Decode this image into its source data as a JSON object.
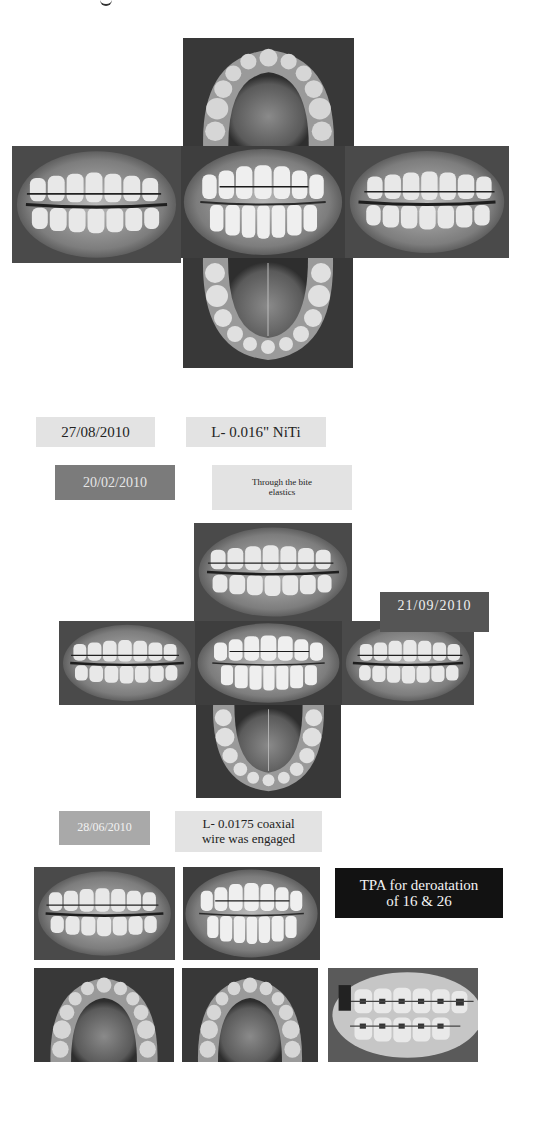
{
  "page": {
    "top_text_fragment": "g"
  },
  "cross_1": {
    "caption": "Pre-treatment intraoral photographs",
    "photos": [
      {
        "view": "upper occlusal",
        "icon": "tooth-photo-icon"
      },
      {
        "view": "right buccal",
        "icon": "tooth-photo-icon"
      },
      {
        "view": "frontal",
        "icon": "tooth-photo-icon"
      },
      {
        "view": "left buccal",
        "icon": "tooth-photo-icon"
      },
      {
        "view": "lower occlusal",
        "icon": "tooth-photo-icon"
      }
    ]
  },
  "labels_1": {
    "date_a": "27/08/2010",
    "wire_a": "L- 0.016\" NiTi",
    "date_b": "20/02/2010",
    "note_b_line1": "Through the bite",
    "note_b_line2": "elastics"
  },
  "cross_2": {
    "date_badge": "21/09/2010",
    "photos": [
      {
        "view": "right buccal (top)",
        "icon": "tooth-photo-icon"
      },
      {
        "view": "right buccal",
        "icon": "tooth-photo-icon"
      },
      {
        "view": "frontal",
        "icon": "tooth-photo-icon"
      },
      {
        "view": "left buccal",
        "icon": "tooth-photo-icon"
      },
      {
        "view": "lower occlusal",
        "icon": "tooth-photo-icon"
      }
    ]
  },
  "labels_2": {
    "date_c": "28/06/2010",
    "wire_c_line1": "L- 0.0175 coaxial",
    "wire_c_line2": "wire was engaged"
  },
  "grid": {
    "tpa_line1": "TPA for deroatation",
    "tpa_line2": "of 16 & 26",
    "photos": [
      {
        "view": "right buccal",
        "icon": "tooth-photo-icon"
      },
      {
        "view": "frontal",
        "icon": "tooth-photo-icon"
      },
      {
        "view": "upper occlusal with TPA",
        "icon": "tooth-photo-icon"
      },
      {
        "view": "upper occlusal",
        "icon": "tooth-photo-icon"
      },
      {
        "view": "left buccal",
        "icon": "tooth-photo-icon"
      }
    ]
  },
  "colors": {
    "light_label": "#e3e3e3",
    "mid_label": "#7b7b7b",
    "soft_label": "#a9a9a9",
    "dark_badge": "#555555",
    "black_label": "#121212"
  }
}
